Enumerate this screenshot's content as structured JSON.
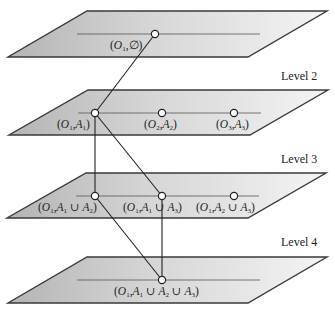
{
  "diagram": {
    "type": "layered-lattice",
    "levels": [
      {
        "id": 1,
        "label": "",
        "nodes": [
          {
            "id": "n1",
            "text": "(O1,∅)",
            "parts": {
              "o": "O",
              "osub": "1",
              "rest": ",∅)"
            }
          }
        ]
      },
      {
        "id": 2,
        "label": "Level 2",
        "nodes": [
          {
            "id": "n2a",
            "text": "(O1,A1)"
          },
          {
            "id": "n2b",
            "text": "(O2,A2)"
          },
          {
            "id": "n2c",
            "text": "(O3,A3)"
          }
        ]
      },
      {
        "id": 3,
        "label": "Level 3",
        "nodes": [
          {
            "id": "n3a",
            "text": "(O1,A1 ∪ A2)"
          },
          {
            "id": "n3b",
            "text": "(O1,A1 ∪ A3)"
          },
          {
            "id": "n3c",
            "text": "(O1,A2 ∪ A3)"
          }
        ]
      },
      {
        "id": 4,
        "label": "Level 4",
        "nodes": [
          {
            "id": "n4a",
            "text": "(O1,A1 ∪ A2 ∪ A3)"
          }
        ]
      }
    ],
    "edges": [
      [
        "n1",
        "n2a"
      ],
      [
        "n2a",
        "n3a"
      ],
      [
        "n2a",
        "n3b"
      ],
      [
        "n3a",
        "n4a"
      ],
      [
        "n3b",
        "n4a"
      ]
    ],
    "colors": {
      "plane_dark": "#b4b4b4",
      "plane_light": "#f4f4f4",
      "stroke": "#3a3a3a"
    }
  }
}
